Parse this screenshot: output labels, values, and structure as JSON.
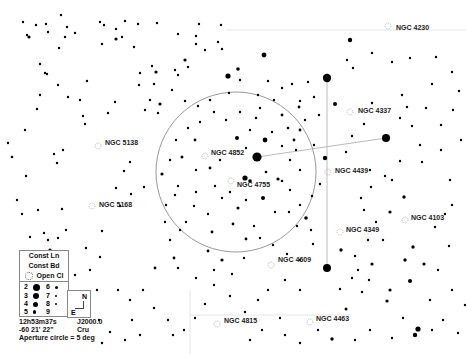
{
  "map": {
    "background": "#ffffff",
    "star_color": "#000000",
    "line_color": "#bbbbbb",
    "aperture_circle": {
      "cx": 236,
      "cy": 172,
      "r": 80,
      "color": "#999999"
    },
    "constellation_lines": [
      {
        "x1": 257,
        "y1": 157,
        "x2": 386,
        "y2": 138
      },
      {
        "x1": 327,
        "y1": 78,
        "x2": 327,
        "y2": 268
      }
    ],
    "grid_lines": [
      {
        "x1": 226,
        "y1": 30,
        "x2": 466,
        "y2": 30
      },
      {
        "x1": 190,
        "y1": 315,
        "x2": 350,
        "y2": 315
      },
      {
        "x1": 190,
        "y1": 290,
        "x2": 190,
        "y2": 354
      }
    ],
    "objects": [
      {
        "name": "NGC 4230",
        "x": 392,
        "y": 27,
        "marker_x": 388,
        "marker_y": 26
      },
      {
        "name": "NGC 4337",
        "x": 354,
        "y": 110,
        "marker_x": 350,
        "marker_y": 112
      },
      {
        "name": "NGC 5138",
        "x": 101,
        "y": 142,
        "marker_x": 98,
        "marker_y": 146
      },
      {
        "name": "NGC 4852",
        "x": 207,
        "y": 152,
        "marker_x": 205,
        "marker_y": 156
      },
      {
        "name": "NGC 4439",
        "x": 331,
        "y": 170,
        "marker_x": 328,
        "marker_y": 172
      },
      {
        "name": "NGC 4755",
        "x": 233,
        "y": 184,
        "marker_x": 231,
        "marker_y": 181
      },
      {
        "name": "NGC 5168",
        "x": 95,
        "y": 204,
        "marker_x": 92,
        "marker_y": 206
      },
      {
        "name": "NGC 4103",
        "x": 407,
        "y": 217,
        "marker_x": 405,
        "marker_y": 220
      },
      {
        "name": "NGC 4349",
        "x": 342,
        "y": 229,
        "marker_x": 340,
        "marker_y": 232
      },
      {
        "name": "NGC 4609",
        "x": 274,
        "y": 259,
        "marker_x": 271,
        "marker_y": 265
      },
      {
        "name": "NGC 4815",
        "x": 220,
        "y": 320,
        "marker_x": 217,
        "marker_y": 324
      },
      {
        "name": "NGC 4463",
        "x": 312,
        "y": 318,
        "marker_x": 310,
        "marker_y": 322
      }
    ],
    "stars": [
      [
        327,
        78,
        4.2
      ],
      [
        386,
        138,
        4.0
      ],
      [
        257,
        157,
        4.6
      ],
      [
        228,
        76,
        2.6
      ],
      [
        264,
        55,
        2.4
      ],
      [
        238,
        69,
        1.8
      ],
      [
        350,
        40,
        2.2
      ],
      [
        335,
        104,
        2.0
      ],
      [
        265,
        140,
        2.4
      ],
      [
        237,
        138,
        2.0
      ],
      [
        263,
        198,
        2.0
      ],
      [
        306,
        218,
        1.8
      ],
      [
        327,
        268,
        4.0
      ],
      [
        325,
        158,
        2.2
      ],
      [
        278,
        179,
        1.6
      ],
      [
        245,
        178,
        2.6
      ],
      [
        250,
        181,
        1.8
      ],
      [
        341,
        250,
        1.7
      ],
      [
        390,
        212,
        1.6
      ],
      [
        404,
        197,
        1.7
      ],
      [
        413,
        247,
        1.7
      ],
      [
        405,
        260,
        1.7
      ],
      [
        390,
        290,
        1.6
      ],
      [
        372,
        264,
        1.6
      ],
      [
        387,
        301,
        1.6
      ],
      [
        410,
        281,
        2.0
      ],
      [
        424,
        264,
        1.6
      ],
      [
        418,
        329,
        2.6
      ],
      [
        415,
        335,
        2.2
      ],
      [
        332,
        339,
        1.7
      ],
      [
        346,
        309,
        1.5
      ],
      [
        222,
        260,
        1.6
      ],
      [
        160,
        104,
        1.6
      ],
      [
        162,
        174,
        1.6
      ],
      [
        195,
        140,
        1.4
      ],
      [
        182,
        157,
        1.5
      ],
      [
        210,
        168,
        1.4
      ],
      [
        238,
        208,
        1.5
      ],
      [
        212,
        232,
        1.4
      ],
      [
        266,
        172,
        1.3
      ],
      [
        282,
        181,
        1.3
      ],
      [
        256,
        118,
        1.3
      ],
      [
        282,
        115,
        1.4
      ],
      [
        288,
        128,
        1.3
      ],
      [
        300,
        130,
        1.4
      ],
      [
        299,
        107,
        1.4
      ],
      [
        294,
        140,
        1.4
      ],
      [
        233,
        224,
        1.4
      ],
      [
        246,
        239,
        1.4
      ],
      [
        260,
        238,
        1.2
      ],
      [
        155,
        268,
        1.4
      ],
      [
        174,
        258,
        1.4
      ],
      [
        208,
        251,
        1.4
      ],
      [
        100,
        257,
        1.2
      ],
      [
        178,
        186,
        1.2
      ],
      [
        144,
        187,
        1.2
      ],
      [
        131,
        194,
        1.2
      ],
      [
        116,
        188,
        1.2
      ],
      [
        102,
        231,
        1.2
      ],
      [
        120,
        206,
        1.2
      ],
      [
        165,
        222,
        1.2
      ],
      [
        180,
        230,
        1.2
      ],
      [
        124,
        171,
        1.2
      ],
      [
        130,
        162,
        1.2
      ],
      [
        85,
        124,
        1.2
      ],
      [
        80,
        100,
        1.2
      ],
      [
        68,
        97,
        1.2
      ],
      [
        58,
        85,
        1.2
      ],
      [
        45,
        73,
        1.2
      ],
      [
        40,
        64,
        1.2
      ],
      [
        29,
        37,
        1.6
      ],
      [
        47,
        74,
        1.2
      ],
      [
        40,
        95,
        1.2
      ],
      [
        37,
        109,
        1.2
      ],
      [
        25,
        130,
        1.2
      ],
      [
        8,
        143,
        1.2
      ],
      [
        12,
        157,
        1.3
      ],
      [
        54,
        154,
        1.2
      ],
      [
        63,
        150,
        1.2
      ],
      [
        57,
        163,
        1.2
      ],
      [
        26,
        176,
        1.2
      ],
      [
        17,
        200,
        1.2
      ],
      [
        22,
        214,
        1.2
      ],
      [
        48,
        240,
        1.2
      ],
      [
        50,
        250,
        1.6
      ],
      [
        44,
        233,
        1.2
      ],
      [
        30,
        237,
        1.2
      ],
      [
        58,
        238,
        1.2
      ],
      [
        66,
        230,
        1.2
      ],
      [
        62,
        209,
        1.2
      ],
      [
        38,
        210,
        1.2
      ],
      [
        61,
        15,
        1.2
      ],
      [
        67,
        27,
        1.2
      ],
      [
        75,
        33,
        1.2
      ],
      [
        23,
        22,
        1.2
      ],
      [
        27,
        35,
        1.2
      ],
      [
        36,
        25,
        1.2
      ],
      [
        46,
        24,
        1.2
      ],
      [
        48,
        32,
        1.2
      ],
      [
        59,
        48,
        1.2
      ],
      [
        65,
        37,
        1.2
      ],
      [
        116,
        39,
        1.6
      ],
      [
        122,
        37,
        1.2
      ],
      [
        125,
        21,
        1.2
      ],
      [
        138,
        24,
        1.2
      ],
      [
        156,
        72,
        1.6
      ],
      [
        154,
        84,
        1.2
      ],
      [
        152,
        66,
        1.2
      ],
      [
        140,
        73,
        1.2
      ],
      [
        157,
        23,
        1.2
      ],
      [
        100,
        22,
        1.2
      ],
      [
        102,
        44,
        1.2
      ],
      [
        104,
        25,
        1.2
      ],
      [
        116,
        29,
        1.2
      ],
      [
        134,
        47,
        1.2
      ],
      [
        87,
        81,
        1.2
      ],
      [
        115,
        102,
        1.2
      ],
      [
        108,
        113,
        1.2
      ],
      [
        83,
        116,
        1.2
      ],
      [
        145,
        110,
        1.2
      ],
      [
        158,
        113,
        1.2
      ],
      [
        150,
        100,
        1.2
      ],
      [
        139,
        85,
        1.2
      ],
      [
        178,
        34,
        1.2
      ],
      [
        196,
        36,
        1.2
      ],
      [
        196,
        44,
        1.2
      ],
      [
        199,
        24,
        1.2
      ],
      [
        221,
        25,
        1.2
      ],
      [
        218,
        42,
        1.2
      ],
      [
        222,
        49,
        1.2
      ],
      [
        205,
        50,
        1.2
      ],
      [
        185,
        60,
        1.6
      ],
      [
        188,
        67,
        1.2
      ],
      [
        175,
        70,
        1.2
      ],
      [
        178,
        75,
        1.2
      ],
      [
        172,
        90,
        1.2
      ],
      [
        185,
        101,
        1.2
      ],
      [
        198,
        106,
        1.2
      ],
      [
        210,
        100,
        1.2
      ],
      [
        229,
        93,
        1.2
      ],
      [
        240,
        80,
        1.2
      ],
      [
        258,
        95,
        1.2
      ],
      [
        268,
        81,
        1.2
      ],
      [
        282,
        88,
        1.2
      ],
      [
        292,
        84,
        1.2
      ],
      [
        300,
        101,
        1.2
      ],
      [
        305,
        120,
        1.2
      ],
      [
        314,
        97,
        1.2
      ],
      [
        308,
        82,
        1.2
      ],
      [
        319,
        115,
        1.2
      ],
      [
        347,
        60,
        1.2
      ],
      [
        353,
        68,
        1.2
      ],
      [
        372,
        53,
        1.2
      ],
      [
        392,
        62,
        1.2
      ],
      [
        410,
        58,
        1.2
      ],
      [
        436,
        57,
        1.2
      ],
      [
        432,
        84,
        1.2
      ],
      [
        452,
        72,
        1.2
      ],
      [
        459,
        91,
        1.2
      ],
      [
        453,
        110,
        1.2
      ],
      [
        441,
        125,
        1.2
      ],
      [
        426,
        108,
        1.2
      ],
      [
        407,
        107,
        1.2
      ],
      [
        402,
        95,
        1.2
      ],
      [
        420,
        145,
        1.2
      ],
      [
        441,
        150,
        1.2
      ],
      [
        461,
        140,
        1.2
      ],
      [
        450,
        180,
        1.2
      ],
      [
        452,
        205,
        1.2
      ],
      [
        445,
        214,
        1.2
      ],
      [
        435,
        227,
        1.2
      ],
      [
        449,
        246,
        1.2
      ],
      [
        438,
        270,
        1.2
      ],
      [
        452,
        290,
        1.2
      ],
      [
        430,
        300,
        1.2
      ],
      [
        443,
        320,
        1.2
      ],
      [
        458,
        333,
        1.2
      ],
      [
        370,
        170,
        1.2
      ],
      [
        371,
        187,
        1.2
      ],
      [
        361,
        198,
        1.2
      ],
      [
        385,
        176,
        1.2
      ],
      [
        346,
        152,
        1.2
      ],
      [
        352,
        136,
        1.2
      ],
      [
        364,
        124,
        1.2
      ],
      [
        372,
        103,
        1.2
      ],
      [
        400,
        118,
        1.2
      ],
      [
        412,
        126,
        1.2
      ],
      [
        422,
        162,
        1.2
      ],
      [
        400,
        161,
        1.2
      ],
      [
        392,
        180,
        1.2
      ],
      [
        364,
        210,
        1.2
      ],
      [
        376,
        222,
        1.2
      ],
      [
        383,
        240,
        1.2
      ],
      [
        368,
        240,
        1.2
      ],
      [
        355,
        256,
        1.2
      ],
      [
        358,
        270,
        1.2
      ],
      [
        369,
        280,
        1.2
      ],
      [
        362,
        292,
        1.2
      ],
      [
        352,
        278,
        1.2
      ],
      [
        340,
        289,
        1.2
      ],
      [
        300,
        290,
        1.2
      ],
      [
        285,
        280,
        1.2
      ],
      [
        268,
        290,
        1.2
      ],
      [
        258,
        300,
        1.2
      ],
      [
        245,
        312,
        1.2
      ],
      [
        230,
        296,
        1.2
      ],
      [
        214,
        285,
        1.2
      ],
      [
        205,
        304,
        1.2
      ],
      [
        195,
        318,
        1.2
      ],
      [
        184,
        330,
        1.2
      ],
      [
        173,
        335,
        1.2
      ],
      [
        168,
        320,
        1.2
      ],
      [
        154,
        308,
        1.2
      ],
      [
        143,
        290,
        1.2
      ],
      [
        130,
        300,
        1.2
      ],
      [
        118,
        290,
        1.2
      ],
      [
        132,
        320,
        1.2
      ],
      [
        110,
        332,
        1.2
      ],
      [
        125,
        340,
        1.2
      ],
      [
        140,
        335,
        1.2
      ],
      [
        99,
        320,
        1.2
      ],
      [
        97,
        290,
        1.2
      ],
      [
        90,
        270,
        1.2
      ],
      [
        86,
        248,
        1.2
      ],
      [
        75,
        275,
        1.2
      ],
      [
        102,
        343,
        1.2
      ],
      [
        285,
        335,
        1.2
      ],
      [
        300,
        343,
        1.2
      ],
      [
        262,
        330,
        1.2
      ],
      [
        250,
        340,
        1.2
      ],
      [
        280,
        318,
        1.2
      ],
      [
        318,
        330,
        1.2
      ],
      [
        355,
        340,
        1.2
      ],
      [
        370,
        330,
        1.2
      ],
      [
        392,
        338,
        1.2
      ],
      [
        403,
        318,
        1.2
      ],
      [
        432,
        330,
        1.2
      ],
      [
        465,
        305,
        1.2
      ],
      [
        178,
        268,
        1.2
      ],
      [
        196,
        278,
        1.2
      ],
      [
        214,
        270,
        1.2
      ],
      [
        232,
        274,
        1.2
      ],
      [
        244,
        258,
        1.2
      ],
      [
        273,
        245,
        1.2
      ],
      [
        287,
        254,
        1.2
      ],
      [
        300,
        260,
        1.2
      ],
      [
        313,
        244,
        1.2
      ],
      [
        311,
        230,
        1.2
      ],
      [
        297,
        226,
        1.2
      ],
      [
        289,
        212,
        1.2
      ],
      [
        275,
        212,
        1.2
      ],
      [
        254,
        226,
        1.2
      ],
      [
        246,
        200,
        1.2
      ],
      [
        222,
        198,
        1.2
      ],
      [
        208,
        214,
        1.2
      ],
      [
        194,
        206,
        1.2
      ],
      [
        186,
        222,
        1.2
      ],
      [
        170,
        240,
        1.2
      ],
      [
        166,
        205,
        1.2
      ],
      [
        175,
        195,
        1.2
      ],
      [
        196,
        192,
        1.2
      ],
      [
        215,
        186,
        1.2
      ],
      [
        230,
        192,
        1.2
      ],
      [
        290,
        190,
        1.2
      ],
      [
        300,
        205,
        1.2
      ],
      [
        312,
        196,
        1.2
      ],
      [
        320,
        184,
        1.2
      ],
      [
        300,
        170,
        1.2
      ],
      [
        290,
        160,
        1.2
      ],
      [
        296,
        150,
        1.2
      ],
      [
        314,
        145,
        1.2
      ],
      [
        282,
        146,
        1.2
      ],
      [
        272,
        132,
        1.2
      ],
      [
        250,
        130,
        1.2
      ],
      [
        240,
        112,
        1.2
      ],
      [
        226,
        120,
        1.2
      ],
      [
        214,
        112,
        1.2
      ],
      [
        200,
        122,
        1.2
      ],
      [
        188,
        128,
        1.2
      ],
      [
        176,
        140,
        1.2
      ],
      [
        170,
        160,
        1.2
      ],
      [
        196,
        170,
        1.2
      ],
      [
        220,
        160,
        1.2
      ],
      [
        246,
        148,
        1.2
      ],
      [
        260,
        108,
        1.2
      ],
      [
        274,
        100,
        1.2
      ]
    ]
  },
  "legend": {
    "items": [
      {
        "label": "Const Ln"
      },
      {
        "label": "Const Bd"
      },
      {
        "label": "Open Cl"
      }
    ],
    "magnitudes": [
      {
        "mag": "2",
        "size": 7
      },
      {
        "mag": "3",
        "size": 6
      },
      {
        "mag": "4",
        "size": 5
      },
      {
        "mag": "5",
        "size": 3.5
      },
      {
        "mag": "6",
        "size": 3
      },
      {
        "mag": "7",
        "size": 2.5
      },
      {
        "mag": "8",
        "size": 2
      },
      {
        "mag": "9",
        "size": 1.5
      }
    ],
    "compass": {
      "north": "N",
      "east": "E"
    }
  },
  "info": {
    "ra": "12h53m37s",
    "epoch": "J2000.0",
    "dec": "-60 21' 22\"",
    "constellation": "Cru",
    "aperture": "Aperture circle = 5 deg"
  }
}
